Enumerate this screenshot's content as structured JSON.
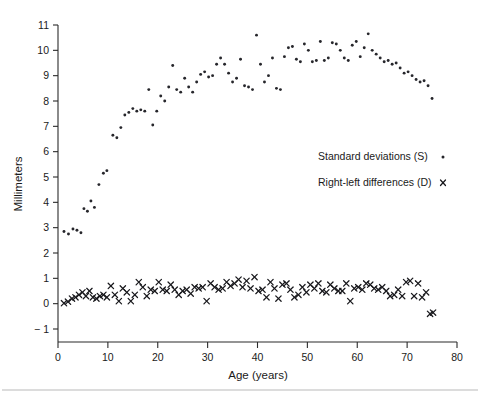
{
  "figure": {
    "xlabel": "Age (years)",
    "ylabel": "Millimeters",
    "legend": [
      {
        "label": "Standard deviations (S)",
        "marker": "dot-marker-icon"
      },
      {
        "label": "Right-left differences (D)",
        "marker": "x-marker-icon"
      }
    ],
    "x_ticks": [
      "0",
      "10",
      "20",
      "30",
      "40",
      "50",
      "60",
      "70",
      "80"
    ],
    "y_ticks": [
      "-1",
      "0",
      "1",
      "2",
      "3",
      "4",
      "5",
      "6",
      "7",
      "8",
      "9",
      "10",
      "11"
    ]
  },
  "chart_data": {
    "type": "scatter",
    "title": "",
    "xlabel": "Age (years)",
    "ylabel": "Millimeters",
    "xlim": [
      0,
      80
    ],
    "ylim": [
      -1,
      11
    ],
    "xticks": [
      0,
      10,
      20,
      30,
      40,
      50,
      60,
      70,
      80
    ],
    "yticks": [
      -1,
      0,
      1,
      2,
      3,
      4,
      5,
      6,
      7,
      8,
      9,
      10,
      11
    ],
    "grid": false,
    "legend_position": "center-right",
    "series": [
      {
        "name": "Standard deviations (S)",
        "marker": "dot",
        "color": "#26262b",
        "points": [
          [
            1.2,
            2.85
          ],
          [
            2.1,
            2.75
          ],
          [
            3.0,
            2.95
          ],
          [
            3.8,
            2.9
          ],
          [
            4.6,
            2.8
          ],
          [
            5.2,
            3.75
          ],
          [
            5.9,
            3.65
          ],
          [
            6.6,
            4.05
          ],
          [
            7.3,
            3.8
          ],
          [
            8.2,
            4.7
          ],
          [
            9.1,
            5.15
          ],
          [
            9.8,
            5.25
          ],
          [
            11.0,
            6.65
          ],
          [
            11.8,
            6.55
          ],
          [
            12.6,
            6.95
          ],
          [
            13.4,
            7.45
          ],
          [
            14.2,
            7.55
          ],
          [
            15.0,
            7.7
          ],
          [
            15.8,
            7.6
          ],
          [
            16.6,
            7.65
          ],
          [
            17.4,
            7.6
          ],
          [
            18.2,
            8.45
          ],
          [
            19.0,
            7.05
          ],
          [
            19.8,
            7.6
          ],
          [
            20.6,
            8.2
          ],
          [
            21.4,
            8.0
          ],
          [
            22.2,
            8.55
          ],
          [
            23.0,
            9.4
          ],
          [
            23.8,
            8.45
          ],
          [
            24.6,
            8.35
          ],
          [
            25.4,
            8.9
          ],
          [
            26.2,
            8.55
          ],
          [
            27.0,
            8.35
          ],
          [
            27.8,
            8.75
          ],
          [
            28.6,
            9.05
          ],
          [
            29.4,
            9.15
          ],
          [
            30.2,
            8.95
          ],
          [
            31.0,
            9.0
          ],
          [
            31.8,
            9.45
          ],
          [
            32.6,
            9.7
          ],
          [
            33.4,
            9.45
          ],
          [
            34.2,
            9.1
          ],
          [
            35.0,
            8.75
          ],
          [
            35.8,
            8.9
          ],
          [
            36.6,
            9.65
          ],
          [
            37.4,
            8.6
          ],
          [
            38.2,
            8.55
          ],
          [
            39.0,
            8.45
          ],
          [
            39.8,
            10.6
          ],
          [
            40.6,
            9.45
          ],
          [
            41.4,
            8.75
          ],
          [
            42.2,
            9.0
          ],
          [
            43.0,
            9.7
          ],
          [
            43.8,
            8.5
          ],
          [
            44.6,
            8.45
          ],
          [
            45.4,
            9.75
          ],
          [
            46.2,
            10.1
          ],
          [
            47.0,
            10.15
          ],
          [
            47.8,
            9.65
          ],
          [
            48.6,
            9.55
          ],
          [
            49.4,
            10.25
          ],
          [
            50.2,
            10.0
          ],
          [
            51.0,
            9.55
          ],
          [
            51.8,
            9.6
          ],
          [
            52.6,
            10.35
          ],
          [
            53.4,
            9.6
          ],
          [
            54.2,
            9.7
          ],
          [
            55.0,
            10.3
          ],
          [
            55.8,
            10.25
          ],
          [
            56.6,
            10.0
          ],
          [
            57.4,
            9.7
          ],
          [
            58.2,
            9.6
          ],
          [
            59.0,
            10.2
          ],
          [
            59.8,
            10.35
          ],
          [
            60.6,
            9.75
          ],
          [
            61.4,
            10.1
          ],
          [
            62.2,
            10.65
          ],
          [
            63.0,
            10.0
          ],
          [
            63.8,
            9.85
          ],
          [
            64.6,
            9.7
          ],
          [
            65.4,
            9.55
          ],
          [
            66.2,
            9.6
          ],
          [
            67.0,
            9.45
          ],
          [
            67.8,
            9.5
          ],
          [
            68.6,
            9.3
          ],
          [
            69.4,
            9.1
          ],
          [
            70.2,
            9.15
          ],
          [
            71.0,
            9.0
          ],
          [
            71.8,
            8.85
          ],
          [
            72.6,
            8.75
          ],
          [
            73.4,
            8.8
          ],
          [
            74.2,
            8.6
          ],
          [
            75.0,
            8.1
          ]
        ]
      },
      {
        "name": "Right-left differences (D)",
        "marker": "x",
        "color": "#18181c",
        "points": [
          [
            1.2,
            0.02
          ],
          [
            2.0,
            0.08
          ],
          [
            2.8,
            0.2
          ],
          [
            3.5,
            0.25
          ],
          [
            4.2,
            0.35
          ],
          [
            4.9,
            0.45
          ],
          [
            5.6,
            0.3
          ],
          [
            6.3,
            0.5
          ],
          [
            7.0,
            0.25
          ],
          [
            7.7,
            0.2
          ],
          [
            8.4,
            0.3
          ],
          [
            9.1,
            0.35
          ],
          [
            9.8,
            0.25
          ],
          [
            10.6,
            0.7
          ],
          [
            11.4,
            0.35
          ],
          [
            12.2,
            0.1
          ],
          [
            13.0,
            0.6
          ],
          [
            13.8,
            0.45
          ],
          [
            14.6,
            0.1
          ],
          [
            15.4,
            0.35
          ],
          [
            16.2,
            0.85
          ],
          [
            17.0,
            0.65
          ],
          [
            17.8,
            0.3
          ],
          [
            18.6,
            0.55
          ],
          [
            19.4,
            0.5
          ],
          [
            20.2,
            0.85
          ],
          [
            21.0,
            0.55
          ],
          [
            21.8,
            0.5
          ],
          [
            22.6,
            0.75
          ],
          [
            23.4,
            0.55
          ],
          [
            24.2,
            0.35
          ],
          [
            25.0,
            0.5
          ],
          [
            25.8,
            0.55
          ],
          [
            26.6,
            0.4
          ],
          [
            27.4,
            0.65
          ],
          [
            28.2,
            0.6
          ],
          [
            29.0,
            0.65
          ],
          [
            29.8,
            0.1
          ],
          [
            30.6,
            0.8
          ],
          [
            31.4,
            0.65
          ],
          [
            32.2,
            0.55
          ],
          [
            33.0,
            0.6
          ],
          [
            33.8,
            0.85
          ],
          [
            34.6,
            0.7
          ],
          [
            35.4,
            0.8
          ],
          [
            36.2,
            0.95
          ],
          [
            37.0,
            0.65
          ],
          [
            37.8,
            0.9
          ],
          [
            38.6,
            0.6
          ],
          [
            39.4,
            1.05
          ],
          [
            40.2,
            0.5
          ],
          [
            41.0,
            0.55
          ],
          [
            41.8,
            0.25
          ],
          [
            42.6,
            0.85
          ],
          [
            43.4,
            0.6
          ],
          [
            44.2,
            0.2
          ],
          [
            45.0,
            0.75
          ],
          [
            45.8,
            0.8
          ],
          [
            46.6,
            0.55
          ],
          [
            47.4,
            0.25
          ],
          [
            48.2,
            0.35
          ],
          [
            49.0,
            0.65
          ],
          [
            49.8,
            0.45
          ],
          [
            50.6,
            0.75
          ],
          [
            51.4,
            0.6
          ],
          [
            52.2,
            0.8
          ],
          [
            53.0,
            0.5
          ],
          [
            53.8,
            0.45
          ],
          [
            54.6,
            0.75
          ],
          [
            55.4,
            0.6
          ],
          [
            56.2,
            0.5
          ],
          [
            57.0,
            0.5
          ],
          [
            57.8,
            0.8
          ],
          [
            58.6,
            0.1
          ],
          [
            59.4,
            0.6
          ],
          [
            60.2,
            0.65
          ],
          [
            61.0,
            0.55
          ],
          [
            61.8,
            0.8
          ],
          [
            62.6,
            0.75
          ],
          [
            63.4,
            0.6
          ],
          [
            64.2,
            0.55
          ],
          [
            65.0,
            0.65
          ],
          [
            65.8,
            0.5
          ],
          [
            66.6,
            0.3
          ],
          [
            67.4,
            0.35
          ],
          [
            68.2,
            0.55
          ],
          [
            69.0,
            0.3
          ],
          [
            69.8,
            0.85
          ],
          [
            70.6,
            0.9
          ],
          [
            71.4,
            0.3
          ],
          [
            72.2,
            0.8
          ],
          [
            73.0,
            0.25
          ],
          [
            73.8,
            0.45
          ],
          [
            74.6,
            -0.4
          ],
          [
            75.2,
            -0.35
          ]
        ]
      }
    ]
  }
}
